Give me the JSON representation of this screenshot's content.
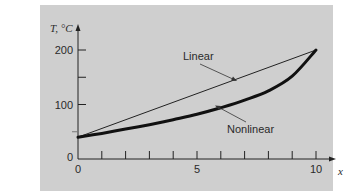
{
  "chart_data": {
    "type": "line",
    "title": "",
    "xlabel": "x",
    "ylabel": "T, °C",
    "xlim": [
      0,
      10
    ],
    "ylim": [
      0,
      200
    ],
    "grid": false,
    "x_ticks": [
      0,
      1,
      2,
      3,
      4,
      5,
      6,
      7,
      8,
      9,
      10
    ],
    "x_tick_labels": [
      "0",
      "5",
      "10"
    ],
    "y_ticks": [
      0,
      50,
      100,
      150,
      200
    ],
    "y_tick_labels": [
      "0",
      "100",
      "200"
    ],
    "series": [
      {
        "name": "Linear",
        "style": "thin",
        "x": [
          0,
          10
        ],
        "y": [
          40,
          200
        ]
      },
      {
        "name": "Nonlinear",
        "style": "thick",
        "x": [
          0,
          1,
          2,
          3,
          4,
          5,
          6,
          7,
          8,
          9,
          10
        ],
        "y": [
          40,
          47,
          55,
          63,
          72,
          82,
          94,
          108,
          125,
          152,
          200
        ]
      }
    ],
    "annotations": [
      {
        "text": "Linear",
        "points_to": "Linear"
      },
      {
        "text": "Nonlinear",
        "points_to": "Nonlinear"
      }
    ],
    "background": "#cfcfcf"
  }
}
